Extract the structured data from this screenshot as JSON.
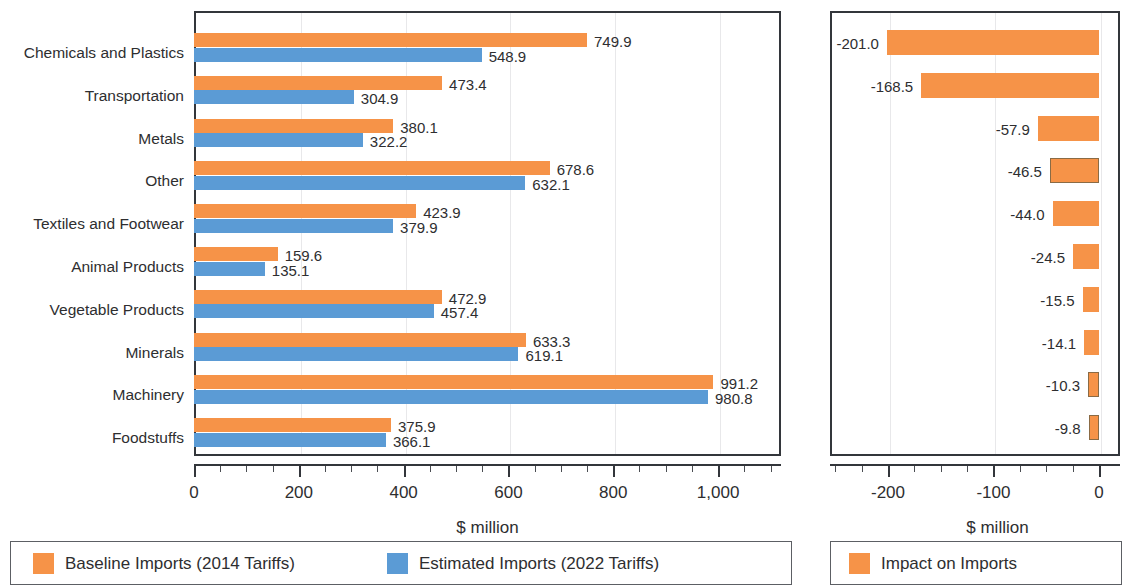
{
  "chart_data": [
    {
      "type": "bar",
      "orientation": "horizontal",
      "title": "",
      "xlabel": "$ million",
      "ylabel": "",
      "xlim": [
        0,
        1120
      ],
      "xticks": [
        0,
        200,
        400,
        600,
        800,
        1000
      ],
      "xtick_labels": [
        "0",
        "200",
        "400",
        "600",
        "800",
        "1,000"
      ],
      "grid": true,
      "legend_position": "bottom",
      "categories": [
        "Chemicals and Plastics",
        "Transportation",
        "Metals",
        "Other",
        "Textiles and Footwear",
        "Animal Products",
        "Vegetable Products",
        "Minerals",
        "Machinery",
        "Foodstuffs"
      ],
      "series": [
        {
          "name": "Baseline Imports (2014 Tariffs)",
          "color": "#F69348",
          "values": [
            749.9,
            473.4,
            380.1,
            678.6,
            423.9,
            159.6,
            472.9,
            633.3,
            991.2,
            375.9
          ],
          "labels": [
            "749.9",
            "473.4",
            "380.1",
            "678.6",
            "423.9",
            "159.6",
            "472.9",
            "633.3",
            "991.2",
            "375.9"
          ]
        },
        {
          "name": "Estimated Imports (2022 Tariffs)",
          "color": "#5B9BD5",
          "values": [
            548.9,
            304.9,
            322.2,
            632.1,
            379.9,
            135.1,
            457.4,
            619.1,
            980.8,
            366.1
          ],
          "labels": [
            "548.9",
            "304.9",
            "322.2",
            "632.1",
            "379.9",
            "135.1",
            "457.4",
            "619.1",
            "980.8",
            "366.1"
          ]
        }
      ],
      "legend": [
        {
          "label": "Baseline Imports (2014 Tariffs)",
          "color": "#F69348"
        },
        {
          "label": "Estimated Imports (2022 Tariffs)",
          "color": "#5B9BD5"
        }
      ]
    },
    {
      "type": "bar",
      "orientation": "horizontal",
      "title": "",
      "xlabel": "$ million",
      "ylabel": "",
      "xlim": [
        -255,
        20
      ],
      "xticks": [
        -200,
        -100,
        0
      ],
      "xtick_labels": [
        "-200",
        "-100",
        "0"
      ],
      "grid": true,
      "legend_position": "bottom",
      "categories": [
        "",
        "",
        "",
        "",
        "",
        "",
        "",
        "",
        "",
        ""
      ],
      "series": [
        {
          "name": "Impact on Imports",
          "color": "#F69348",
          "values": [
            -201.0,
            -168.5,
            -57.9,
            -46.5,
            -44.0,
            -24.5,
            -15.5,
            -14.1,
            -10.3,
            -9.8
          ],
          "labels": [
            "-201.0",
            "-168.5",
            "-57.9",
            "-46.5",
            "-44.0",
            "-24.5",
            "-15.5",
            "-14.1",
            "-10.3",
            "-9.8"
          ],
          "outlined": [
            false,
            false,
            false,
            true,
            false,
            false,
            false,
            false,
            true,
            true
          ]
        }
      ],
      "legend": [
        {
          "label": "Impact on Imports",
          "color": "#F69348"
        }
      ]
    }
  ],
  "left_chart": {
    "axis_title": "$ million",
    "tick_labels": [
      "0",
      "200",
      "400",
      "600",
      "800",
      "1,000"
    ],
    "categories": [
      "Chemicals and Plastics",
      "Transportation",
      "Metals",
      "Other",
      "Textiles and Footwear",
      "Animal Products",
      "Vegetable Products",
      "Minerals",
      "Machinery",
      "Foodstuffs"
    ],
    "baseline_labels": [
      "749.9",
      "473.4",
      "380.1",
      "678.6",
      "423.9",
      "159.6",
      "472.9",
      "633.3",
      "991.2",
      "375.9"
    ],
    "estimated_labels": [
      "548.9",
      "304.9",
      "322.2",
      "632.1",
      "379.9",
      "135.1",
      "457.4",
      "619.1",
      "980.8",
      "366.1"
    ],
    "legend": {
      "baseline": "Baseline Imports (2014 Tariffs)",
      "estimated": "Estimated Imports (2022 Tariffs)"
    }
  },
  "right_chart": {
    "axis_title": "$ million",
    "tick_labels": [
      "-200",
      "-100",
      "0"
    ],
    "impact_labels": [
      "-201.0",
      "-168.5",
      "-57.9",
      "-46.5",
      "-44.0",
      "-24.5",
      "-15.5",
      "-14.1",
      "-10.3",
      "-9.8"
    ],
    "legend": {
      "impact": "Impact on Imports"
    }
  }
}
